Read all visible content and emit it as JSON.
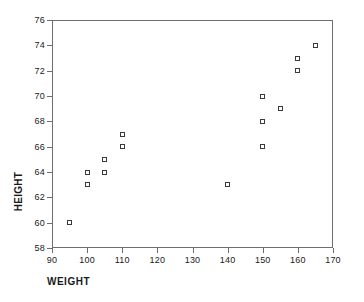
{
  "chart_data": {
    "type": "scatter",
    "title": "",
    "xlabel": "WEIGHT",
    "ylabel": "HEIGHT",
    "xlim": [
      90,
      170
    ],
    "ylim": [
      58,
      76
    ],
    "xticks": [
      90,
      100,
      110,
      120,
      130,
      140,
      150,
      160,
      170
    ],
    "yticks": [
      58,
      60,
      62,
      64,
      66,
      68,
      70,
      72,
      74,
      76
    ],
    "grid": false,
    "legend": null,
    "marker": "open-square",
    "marker_color": "#3a3a3a",
    "frame_color": "#6e6e6e",
    "points": [
      {
        "x": 95,
        "y": 60
      },
      {
        "x": 100,
        "y": 63
      },
      {
        "x": 100,
        "y": 64
      },
      {
        "x": 105,
        "y": 64
      },
      {
        "x": 105,
        "y": 65
      },
      {
        "x": 110,
        "y": 66
      },
      {
        "x": 110,
        "y": 67
      },
      {
        "x": 140,
        "y": 63
      },
      {
        "x": 150,
        "y": 66
      },
      {
        "x": 150,
        "y": 68
      },
      {
        "x": 150,
        "y": 70
      },
      {
        "x": 155,
        "y": 69
      },
      {
        "x": 160,
        "y": 72
      },
      {
        "x": 160,
        "y": 73
      },
      {
        "x": 165,
        "y": 74
      }
    ]
  }
}
